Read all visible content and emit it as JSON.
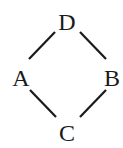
{
  "diagram": {
    "type": "hasse-diagram",
    "nodes": [
      {
        "id": "D",
        "label": "D",
        "x": 67,
        "y": 30
      },
      {
        "id": "A",
        "label": "A",
        "x": 21,
        "y": 86
      },
      {
        "id": "B",
        "label": "B",
        "x": 112,
        "y": 86
      },
      {
        "id": "C",
        "label": "C",
        "x": 67,
        "y": 141
      }
    ],
    "edges": [
      {
        "from": "D",
        "to": "A"
      },
      {
        "from": "D",
        "to": "B"
      },
      {
        "from": "A",
        "to": "C"
      },
      {
        "from": "B",
        "to": "C"
      }
    ],
    "colors": {
      "ink": "#1a1a1a",
      "background": "#ffffff"
    }
  }
}
